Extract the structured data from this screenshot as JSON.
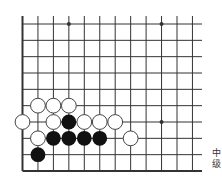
{
  "diagram": {
    "type": "go-problem",
    "board_view": "partial lower-left corner",
    "columns_visible": 12,
    "rows_visible": 10,
    "edges": [
      "left",
      "bottom"
    ],
    "star_points": [
      {
        "col": 3,
        "row": 0
      },
      {
        "col": 9,
        "row": 0
      },
      {
        "col": 9,
        "row": 6
      }
    ],
    "stones": [
      {
        "color": "white",
        "col": 1,
        "row": 5
      },
      {
        "color": "white",
        "col": 2,
        "row": 5
      },
      {
        "color": "white",
        "col": 3,
        "row": 5
      },
      {
        "color": "white",
        "col": 0,
        "row": 6
      },
      {
        "color": "white",
        "col": 2,
        "row": 6
      },
      {
        "color": "black",
        "col": 3,
        "row": 6
      },
      {
        "color": "white",
        "col": 4,
        "row": 6
      },
      {
        "color": "white",
        "col": 5,
        "row": 6
      },
      {
        "color": "white",
        "col": 6,
        "row": 6
      },
      {
        "color": "white",
        "col": 1,
        "row": 7
      },
      {
        "color": "black",
        "col": 2,
        "row": 7
      },
      {
        "color": "black",
        "col": 3,
        "row": 7
      },
      {
        "color": "black",
        "col": 4,
        "row": 7
      },
      {
        "color": "black",
        "col": 5,
        "row": 7
      },
      {
        "color": "white",
        "col": 7,
        "row": 7
      },
      {
        "color": "black",
        "col": 1,
        "row": 8
      }
    ],
    "colors": {
      "line": "#333333",
      "black_stone": "#111111",
      "white_stone_fill": "#ffffff",
      "white_stone_stroke": "#444444"
    }
  },
  "caption": {
    "line1": "中",
    "line2": "级"
  }
}
